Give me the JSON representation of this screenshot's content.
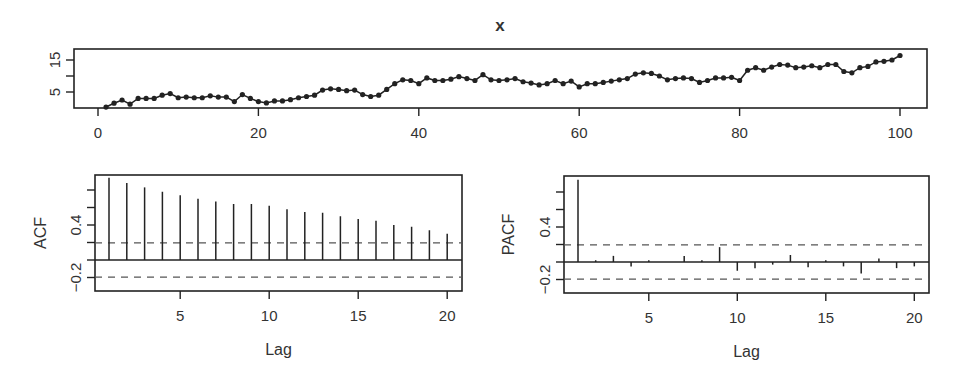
{
  "chart_data": [
    {
      "type": "line",
      "title": "x",
      "xlabel": "",
      "ylabel": "",
      "xlim": [
        0,
        100
      ],
      "ylim": [
        0,
        18
      ],
      "x_ticks": [
        "0",
        "20",
        "40",
        "60",
        "80",
        "100"
      ],
      "y_ticks": [
        "5",
        "15"
      ],
      "markers": true,
      "x": [
        1,
        2,
        3,
        4,
        5,
        6,
        7,
        8,
        9,
        10,
        11,
        12,
        13,
        14,
        15,
        16,
        17,
        18,
        19,
        20,
        21,
        22,
        23,
        24,
        25,
        26,
        27,
        28,
        29,
        30,
        31,
        32,
        33,
        34,
        35,
        36,
        37,
        38,
        39,
        40,
        41,
        42,
        43,
        44,
        45,
        46,
        47,
        48,
        49,
        50,
        51,
        52,
        53,
        54,
        55,
        56,
        57,
        58,
        59,
        60,
        61,
        62,
        63,
        64,
        65,
        66,
        67,
        68,
        69,
        70,
        71,
        72,
        73,
        74,
        75,
        76,
        77,
        78,
        79,
        80,
        81,
        82,
        83,
        84,
        85,
        86,
        87,
        88,
        89,
        90,
        91,
        92,
        93,
        94,
        95,
        96,
        97,
        98,
        99,
        100
      ],
      "values": [
        0.3,
        1.5,
        2.5,
        1.2,
        3.0,
        3.0,
        3.0,
        4.0,
        4.5,
        3.2,
        3.4,
        3.2,
        3.2,
        3.8,
        3.4,
        3.4,
        2.0,
        4.2,
        3.0,
        2.0,
        1.6,
        2.2,
        2.2,
        2.6,
        3.2,
        3.6,
        4.0,
        5.6,
        6.0,
        5.8,
        5.4,
        5.6,
        4.2,
        3.6,
        4.0,
        5.8,
        7.6,
        8.8,
        8.6,
        7.6,
        9.4,
        8.6,
        8.6,
        9.0,
        9.8,
        9.2,
        8.6,
        10.4,
        8.8,
        8.6,
        8.8,
        9.2,
        8.2,
        7.8,
        7.2,
        7.6,
        8.6,
        7.6,
        8.4,
        6.6,
        7.6,
        7.6,
        8.0,
        8.4,
        8.8,
        9.2,
        10.6,
        11.0,
        10.8,
        10.0,
        8.8,
        9.2,
        9.4,
        9.2,
        8.0,
        8.6,
        9.4,
        9.4,
        9.6,
        8.6,
        11.8,
        12.6,
        11.8,
        12.8,
        13.6,
        13.4,
        12.6,
        12.8,
        13.2,
        12.6,
        13.6,
        13.6,
        11.4,
        11.0,
        12.6,
        13.0,
        14.4,
        14.6,
        15.0,
        16.4
      ]
    },
    {
      "type": "bar",
      "title": "",
      "xlabel": "Lag",
      "ylabel": "ACF",
      "xlim": [
        0.5,
        20.5
      ],
      "ylim": [
        -0.35,
        1.0
      ],
      "x_ticks": [
        "5",
        "10",
        "15",
        "20"
      ],
      "y_ticks": [
        "-0.2",
        "0.4"
      ],
      "confidence_bounds": [
        0.196,
        -0.196
      ],
      "categories": [
        1,
        2,
        3,
        4,
        5,
        6,
        7,
        8,
        9,
        10,
        11,
        12,
        13,
        14,
        15,
        16,
        17,
        18,
        19,
        20
      ],
      "values": [
        0.94,
        0.88,
        0.83,
        0.78,
        0.74,
        0.7,
        0.67,
        0.64,
        0.64,
        0.62,
        0.58,
        0.55,
        0.54,
        0.5,
        0.47,
        0.45,
        0.4,
        0.38,
        0.34,
        0.3
      ]
    },
    {
      "type": "bar",
      "title": "",
      "xlabel": "Lag",
      "ylabel": "PACF",
      "xlim": [
        0.5,
        20.5
      ],
      "ylim": [
        -0.35,
        1.0
      ],
      "x_ticks": [
        "5",
        "10",
        "15",
        "20"
      ],
      "y_ticks": [
        "-0.2",
        "0.4"
      ],
      "confidence_bounds": [
        0.196,
        -0.196
      ],
      "categories": [
        1,
        2,
        3,
        4,
        5,
        6,
        7,
        8,
        9,
        10,
        11,
        12,
        13,
        14,
        15,
        16,
        17,
        18,
        19,
        20
      ],
      "values": [
        0.94,
        0.02,
        0.07,
        -0.05,
        0.02,
        0.0,
        0.07,
        0.02,
        0.17,
        -0.1,
        -0.07,
        -0.03,
        0.08,
        -0.06,
        0.02,
        -0.05,
        -0.13,
        0.04,
        -0.07,
        -0.05
      ]
    }
  ]
}
